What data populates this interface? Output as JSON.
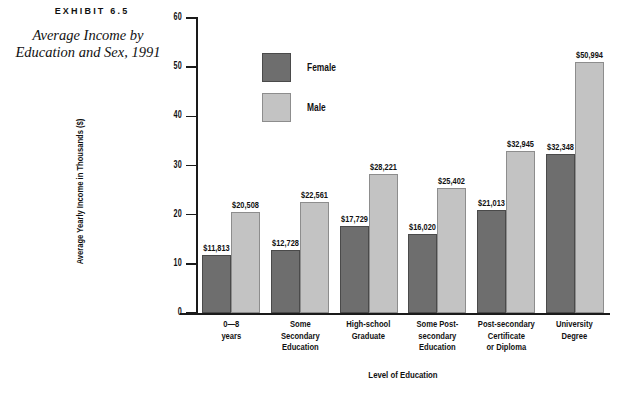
{
  "exhibit": {
    "number": "EXHIBIT 6.5",
    "title_line1": "Average Income by",
    "title_line2": "Education and Sex, 1991"
  },
  "legend": {
    "position": "inside-top-left",
    "items": [
      {
        "label": "Female",
        "color": "#6e6e6e"
      },
      {
        "label": "Male",
        "color": "#c3c3c3"
      }
    ]
  },
  "chart_data": {
    "type": "bar",
    "title": "Average Income by Education and Sex, 1991",
    "xlabel": "Level of Education",
    "ylabel": "Average Yearly Income in Thousands ($)",
    "ylim": [
      0,
      60
    ],
    "yticks": [
      0,
      10,
      20,
      30,
      40,
      50,
      60
    ],
    "ytick_labels": [
      "0",
      "10",
      "20",
      "30",
      "40",
      "50",
      "60"
    ],
    "grid": false,
    "units": "thousands of dollars",
    "categories": [
      "0—8\nyears",
      "Some\nSecondary\nEducation",
      "High-school\nGraduate",
      "Some Post-\nsecondary\nEducation",
      "Post-secondary\nCertificate\nor Diploma",
      "University\nDegree"
    ],
    "category_lines": [
      [
        "0—8",
        "years"
      ],
      [
        "Some",
        "Secondary",
        "Education"
      ],
      [
        "High-school",
        "Graduate"
      ],
      [
        "Some Post-",
        "secondary",
        "Education"
      ],
      [
        "Post-secondary",
        "Certificate",
        "or Diploma"
      ],
      [
        "University",
        "Degree"
      ]
    ],
    "series": [
      {
        "name": "Female",
        "color": "#6e6e6e",
        "values": [
          11.813,
          12.728,
          17.729,
          16.02,
          21.013,
          32.348
        ],
        "data_labels": [
          "$11,813",
          "$12,728",
          "$17,729",
          "$16,020",
          "$21,013",
          "$32,348"
        ]
      },
      {
        "name": "Male",
        "color": "#c3c3c3",
        "values": [
          20.508,
          22.561,
          28.221,
          25.402,
          32.945,
          50.994
        ],
        "data_labels": [
          "$20,508",
          "$22,561",
          "$28,221",
          "$25,402",
          "$32,945",
          "$50,994"
        ]
      }
    ]
  }
}
